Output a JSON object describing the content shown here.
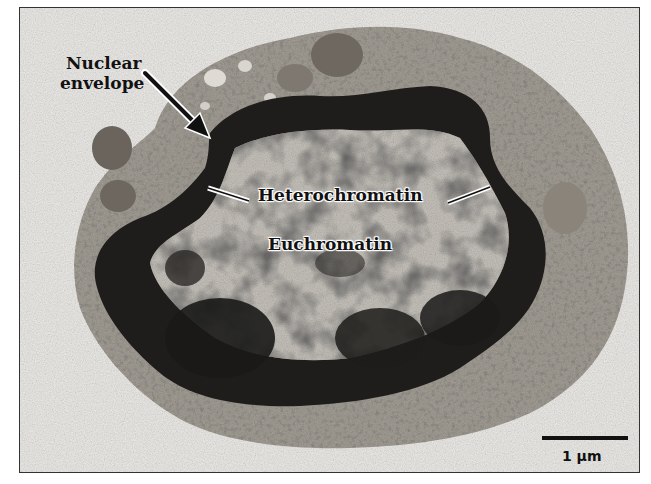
{
  "figure": {
    "type": "transmission electron micrograph",
    "labels": {
      "nuclear_envelope_line1": "Nuclear",
      "nuclear_envelope_line2": "envelope",
      "heterochromatin": "Heterochromatin",
      "euchromatin": "Euchromatin"
    },
    "scale_bar": {
      "label": "1 µm"
    },
    "colors": {
      "background": "#ecebe8",
      "cytoplasm": "#a9a49c",
      "nucleus_light": "#c9c6c0",
      "heterochromatin": "#1c1b1a",
      "label_text": "#111111",
      "frame": "#333333"
    }
  }
}
